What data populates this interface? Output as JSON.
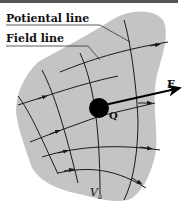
{
  "labels": {
    "potential_line": "Potiental line",
    "field_line": "Field line",
    "force": "F",
    "charge": "Q",
    "potential_symbol": "V",
    "potential_subscript": "a"
  },
  "colors": {
    "region_fill": "#c4c4c4",
    "line": "#1a1a1a",
    "charge": "#000000",
    "background": "#ffffff"
  },
  "elements": {
    "field_lines_count": 5,
    "potential_lines_count": 5,
    "charge_marker": "filled-circle",
    "force_vector": "arrow-right"
  }
}
